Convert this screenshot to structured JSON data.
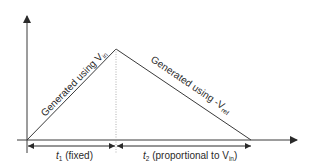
{
  "diagram": {
    "type": "dual-slope integration waveform",
    "colors": {
      "line": "#3a3a3a",
      "text": "#2a2a2a",
      "background": "#ffffff",
      "guide": "#9a9a9a"
    },
    "rise_label": {
      "prefix": "Generated using V",
      "subscript": "in"
    },
    "fall_label": {
      "prefix": "Generated using -V",
      "subscript": "ref"
    },
    "t1_label": {
      "var": "t",
      "subscript": "1",
      "text": " (fixed)"
    },
    "t2_label": {
      "var": "t",
      "subscript": "2",
      "text": " (proportional to V",
      "text_sub": "in",
      "text_end": ")"
    }
  }
}
